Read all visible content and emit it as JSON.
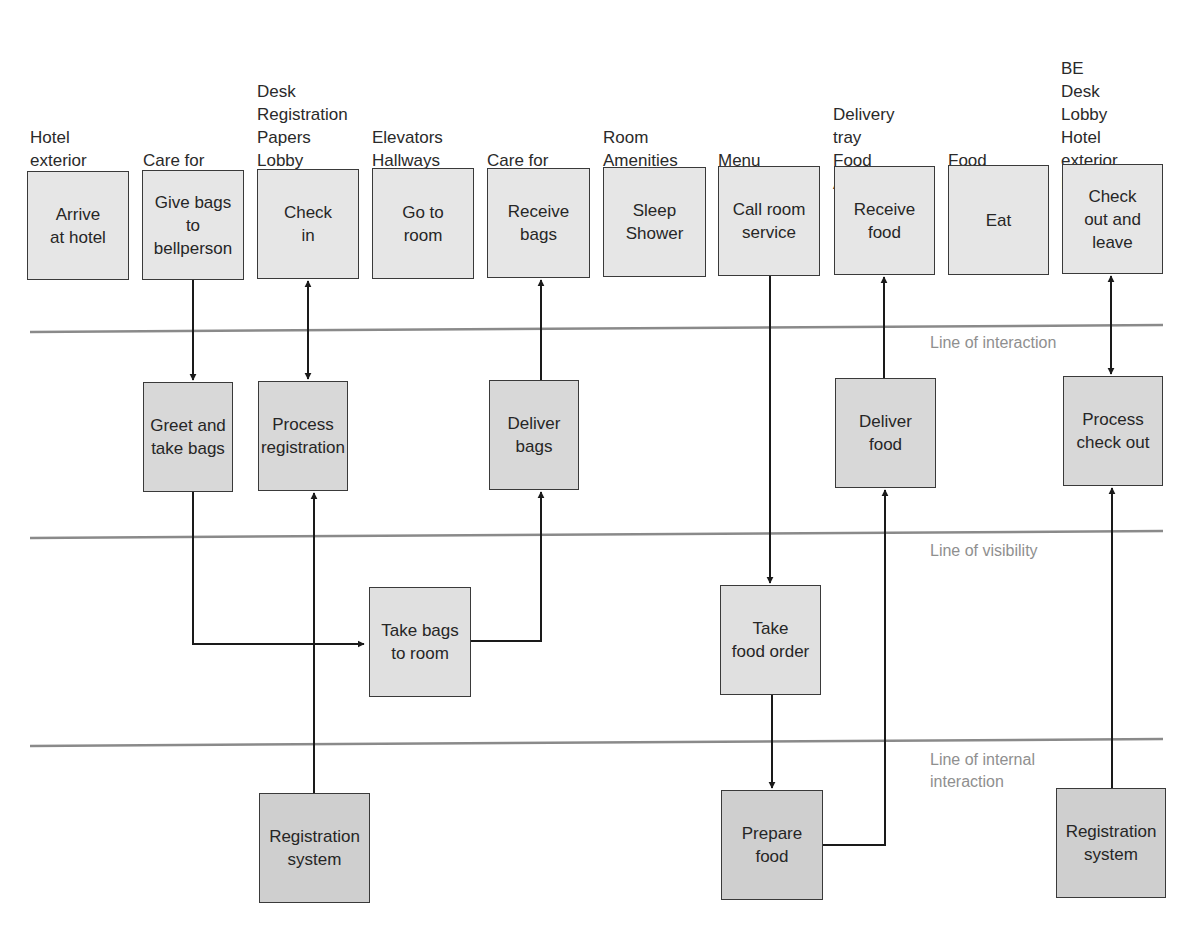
{
  "colors": {
    "divider_line": "#8a8a8a",
    "arrow": "#1a1a1a",
    "box_border": "#3a3a3a",
    "line_label": "#8f8f8f"
  },
  "physical_evidence": [
    {
      "text": "Hotel\nexterior\nParking",
      "x": 30,
      "y": 126
    },
    {
      "text": "Care for\nbags",
      "x": 143,
      "y": 149
    },
    {
      "text": "Desk\nRegistration\nPapers\nLobby\nKey",
      "x": 257,
      "y": 80
    },
    {
      "text": "Elevators\nHallways\nRoom",
      "x": 372,
      "y": 126
    },
    {
      "text": "Care for\nbags",
      "x": 487,
      "y": 149
    },
    {
      "text": "Room\nAmenities\nBath",
      "x": 603,
      "y": 126
    },
    {
      "text": "Menu",
      "x": 718,
      "y": 149
    },
    {
      "text": "Delivery\ntray\nFood\nAppearance",
      "x": 833,
      "y": 103
    },
    {
      "text": "Food",
      "x": 948,
      "y": 149
    },
    {
      "text": "BE\nDesk\nLobby\nHotel\nexterior\nParking",
      "x": 1061,
      "y": 57
    }
  ],
  "lanes": {
    "customer_actions": [
      {
        "id": "arrive",
        "label": "Arrive\nat hotel",
        "x": 27,
        "y": 171,
        "w": 102,
        "h": 109
      },
      {
        "id": "give_bags",
        "label": "Give bags\nto\nbellperson",
        "x": 142,
        "y": 170,
        "w": 102,
        "h": 110
      },
      {
        "id": "check_in",
        "label": "Check\nin",
        "x": 257,
        "y": 169,
        "w": 102,
        "h": 110
      },
      {
        "id": "go_to_room",
        "label": "Go to\nroom",
        "x": 372,
        "y": 168,
        "w": 102,
        "h": 111
      },
      {
        "id": "receive_bags",
        "label": "Receive\nbags",
        "x": 487,
        "y": 168,
        "w": 103,
        "h": 110
      },
      {
        "id": "sleep_shower",
        "label": "Sleep\nShower",
        "x": 603,
        "y": 167,
        "w": 103,
        "h": 110
      },
      {
        "id": "call_room_service",
        "label": "Call room\nservice",
        "x": 718,
        "y": 166,
        "w": 102,
        "h": 110
      },
      {
        "id": "receive_food",
        "label": "Receive\nfood",
        "x": 834,
        "y": 166,
        "w": 101,
        "h": 109
      },
      {
        "id": "eat",
        "label": "Eat",
        "x": 948,
        "y": 165,
        "w": 101,
        "h": 110
      },
      {
        "id": "check_out",
        "label": "Check\nout and\nleave",
        "x": 1062,
        "y": 164,
        "w": 101,
        "h": 110
      }
    ],
    "onstage_contact": [
      {
        "id": "greet",
        "label": "Greet and\ntake bags",
        "x": 143,
        "y": 382,
        "w": 90,
        "h": 110
      },
      {
        "id": "process_registration",
        "label": "Process\nregistration",
        "x": 258,
        "y": 381,
        "w": 90,
        "h": 110
      },
      {
        "id": "deliver_bags",
        "label": "Deliver\nbags",
        "x": 489,
        "y": 380,
        "w": 90,
        "h": 110
      },
      {
        "id": "deliver_food",
        "label": "Deliver\nfood",
        "x": 835,
        "y": 378,
        "w": 101,
        "h": 110
      },
      {
        "id": "process_checkout",
        "label": "Process\ncheck out",
        "x": 1063,
        "y": 376,
        "w": 100,
        "h": 110
      }
    ],
    "backstage_contact": [
      {
        "id": "take_bags_to_room",
        "label": "Take bags\nto room",
        "x": 369,
        "y": 587,
        "w": 102,
        "h": 110
      },
      {
        "id": "take_food_order",
        "label": "Take\nfood order",
        "x": 720,
        "y": 585,
        "w": 101,
        "h": 110
      }
    ],
    "support_processes": [
      {
        "id": "registration_system_1",
        "label": "Registration\nsystem",
        "x": 259,
        "y": 793,
        "w": 111,
        "h": 110
      },
      {
        "id": "prepare_food",
        "label": "Prepare\nfood",
        "x": 721,
        "y": 790,
        "w": 102,
        "h": 110
      },
      {
        "id": "registration_system_2",
        "label": "Registration\nsystem",
        "x": 1056,
        "y": 788,
        "w": 110,
        "h": 110
      }
    ]
  },
  "divider_lines": [
    {
      "id": "line_of_interaction",
      "label": "Line of interaction",
      "x1": 30,
      "y1": 332,
      "x2": 1163,
      "y2": 325,
      "label_x": 930,
      "label_y": 332
    },
    {
      "id": "line_of_visibility",
      "label": "Line of visibility",
      "x1": 30,
      "y1": 538,
      "x2": 1163,
      "y2": 531,
      "label_x": 930,
      "label_y": 540
    },
    {
      "id": "line_of_internal_interaction",
      "label": "Line of internal\ninteraction",
      "x1": 30,
      "y1": 746,
      "x2": 1163,
      "y2": 739,
      "label_x": 930,
      "label_y": 749
    }
  ],
  "connectors": [
    {
      "from": "give_bags",
      "to": "greet",
      "points": [
        [
          193,
          280
        ],
        [
          193,
          380
        ]
      ],
      "arrow": "end"
    },
    {
      "from": "check_in",
      "to": "process_registration",
      "points": [
        [
          308,
          281
        ],
        [
          308,
          379
        ]
      ],
      "arrow": "both"
    },
    {
      "from": "greet",
      "to": "take_bags_to_room",
      "points": [
        [
          193,
          492
        ],
        [
          193,
          644
        ],
        [
          364,
          644
        ]
      ],
      "arrow": "end"
    },
    {
      "from": "registration_system_1",
      "to": "process_registration",
      "points": [
        [
          314,
          793
        ],
        [
          314,
          493
        ]
      ],
      "arrow": "end"
    },
    {
      "from": "take_bags_to_room",
      "to": "deliver_bags",
      "points": [
        [
          471,
          641
        ],
        [
          541,
          641
        ],
        [
          541,
          492
        ]
      ],
      "arrow": "end"
    },
    {
      "from": "deliver_bags",
      "to": "receive_bags",
      "points": [
        [
          541,
          380
        ],
        [
          541,
          280
        ]
      ],
      "arrow": "end"
    },
    {
      "from": "call_room_service",
      "to": "take_food_order",
      "points": [
        [
          770,
          276
        ],
        [
          770,
          583
        ]
      ],
      "arrow": "end"
    },
    {
      "from": "take_food_order",
      "to": "prepare_food",
      "points": [
        [
          772,
          695
        ],
        [
          772,
          788
        ]
      ],
      "arrow": "end"
    },
    {
      "from": "prepare_food",
      "to": "deliver_food",
      "points": [
        [
          823,
          845
        ],
        [
          885,
          845
        ],
        [
          885,
          490
        ]
      ],
      "arrow": "end"
    },
    {
      "from": "deliver_food",
      "to": "receive_food",
      "points": [
        [
          884,
          378
        ],
        [
          884,
          277
        ]
      ],
      "arrow": "end"
    },
    {
      "from": "check_out",
      "to": "process_checkout",
      "points": [
        [
          1111,
          276
        ],
        [
          1111,
          374
        ]
      ],
      "arrow": "both"
    },
    {
      "from": "registration_system_2",
      "to": "process_checkout",
      "points": [
        [
          1112,
          788
        ],
        [
          1112,
          488
        ]
      ],
      "arrow": "end"
    }
  ]
}
